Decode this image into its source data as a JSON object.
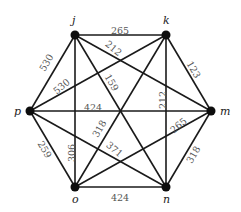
{
  "graph": {
    "nodes": [
      {
        "id": "j",
        "label": "j",
        "x": 75,
        "y": 35,
        "lx": 72,
        "ly": 24
      },
      {
        "id": "k",
        "label": "k",
        "x": 166,
        "y": 35,
        "lx": 163,
        "ly": 24
      },
      {
        "id": "m",
        "label": "m",
        "x": 211,
        "y": 111,
        "lx": 220,
        "ly": 115
      },
      {
        "id": "n",
        "label": "n",
        "x": 166,
        "y": 187,
        "lx": 163,
        "ly": 203
      },
      {
        "id": "o",
        "label": "o",
        "x": 75,
        "y": 187,
        "lx": 72,
        "ly": 203
      },
      {
        "id": "p",
        "label": "p",
        "x": 30,
        "y": 111,
        "lx": 14,
        "ly": 115
      }
    ],
    "edges": [
      {
        "from": "j",
        "to": "k",
        "weight": "265",
        "lx": 120,
        "ly": 31,
        "rot": 0
      },
      {
        "from": "j",
        "to": "m",
        "weight": "212",
        "lx": 113,
        "ly": 49,
        "rot": 40
      },
      {
        "from": "j",
        "to": "n",
        "weight": "159",
        "lx": 111,
        "ly": 83,
        "rot": 60
      },
      {
        "from": "j",
        "to": "o",
        "weight": "306",
        "lx": 72,
        "ly": 153,
        "rot": -90
      },
      {
        "from": "j",
        "to": "p",
        "weight": "530",
        "lx": 47,
        "ly": 63,
        "rot": -60
      },
      {
        "from": "k",
        "to": "m",
        "weight": "123",
        "lx": 193,
        "ly": 70,
        "rot": 60
      },
      {
        "from": "k",
        "to": "n",
        "weight": "212",
        "lx": 163,
        "ly": 100,
        "rot": -90
      },
      {
        "from": "k",
        "to": "o",
        "weight": "318",
        "lx": 100,
        "ly": 129,
        "rot": -60
      },
      {
        "from": "k",
        "to": "p",
        "weight": "530",
        "lx": 62,
        "ly": 87,
        "rot": -40
      },
      {
        "from": "m",
        "to": "n",
        "weight": "318",
        "lx": 194,
        "ly": 155,
        "rot": -60
      },
      {
        "from": "m",
        "to": "o",
        "weight": "265",
        "lx": 179,
        "ly": 126,
        "rot": -40
      },
      {
        "from": "m",
        "to": "p",
        "weight": "424",
        "lx": 93,
        "ly": 108,
        "rot": 0
      },
      {
        "from": "n",
        "to": "o",
        "weight": "424",
        "lx": 120,
        "ly": 198,
        "rot": 0
      },
      {
        "from": "n",
        "to": "p",
        "weight": "371",
        "lx": 114,
        "ly": 150,
        "rot": 40
      },
      {
        "from": "o",
        "to": "p",
        "weight": "259",
        "lx": 44,
        "ly": 150,
        "rot": 60
      }
    ]
  }
}
